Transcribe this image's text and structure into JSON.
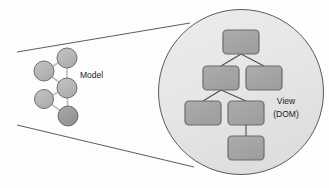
{
  "diagram": {
    "background_color": "#fdfdfd",
    "labels": {
      "model": "Model",
      "view_line1": "View",
      "view_line2": "(DOM)"
    },
    "colors": {
      "node_fill": "#b3b3b3",
      "node_fill_dark": "#9a9a9a",
      "node_stroke": "#6e6e6e",
      "edge_stroke": "#b8b8b8",
      "box_fill": "#a6a6a6",
      "box_stroke": "#6b6b6b",
      "lens_fill": "#e8e8e8",
      "lens_stroke": "#5a5a5a",
      "cone_stroke": "#4a4a4a",
      "text": "#1b1b1b"
    },
    "model_graph": {
      "caption": "Model",
      "nodes": [
        {
          "id": "m1",
          "label": "",
          "cx": 67,
          "cy": 58,
          "r": 10,
          "shade": "light"
        },
        {
          "id": "m2",
          "label": "",
          "cx": 44,
          "cy": 71,
          "r": 10,
          "shade": "light"
        },
        {
          "id": "m3",
          "label": "",
          "cx": 67,
          "cy": 88,
          "r": 10,
          "shade": "light"
        },
        {
          "id": "m4",
          "label": "",
          "cx": 44,
          "cy": 99,
          "r": 9,
          "shade": "light"
        },
        {
          "id": "m5",
          "label": "",
          "cx": 68,
          "cy": 116,
          "r": 10,
          "shade": "dark"
        }
      ],
      "edges": [
        {
          "from": "m2",
          "to": "m1"
        },
        {
          "from": "m2",
          "to": "m3"
        },
        {
          "from": "m1",
          "to": "m3"
        },
        {
          "from": "m4",
          "to": "m3"
        },
        {
          "from": "m3",
          "to": "m5"
        },
        {
          "from": "m4",
          "to": "m5"
        }
      ]
    },
    "magnifier": {
      "cx": 241,
      "cy": 92,
      "r": 83,
      "caption_line1": "View",
      "caption_line2": "(DOM)",
      "caption_x": 286,
      "caption_y": 103
    },
    "cone": {
      "top_from": {
        "x": 17,
        "y": 52
      },
      "top_to": {
        "x": 186,
        "y": 25
      },
      "bottom_from": {
        "x": 17,
        "y": 125
      },
      "bottom_to": {
        "x": 190,
        "y": 166
      }
    },
    "dom_tree": {
      "caption": "View (DOM)",
      "boxes": [
        {
          "id": "d1",
          "label": "",
          "x": 223,
          "y": 30,
          "w": 36,
          "h": 24
        },
        {
          "id": "d2",
          "label": "",
          "x": 203,
          "y": 66,
          "w": 36,
          "h": 24
        },
        {
          "id": "d3",
          "label": "",
          "x": 246,
          "y": 66,
          "w": 36,
          "h": 24
        },
        {
          "id": "d4",
          "label": "",
          "x": 185,
          "y": 101,
          "w": 36,
          "h": 24
        },
        {
          "id": "d5",
          "label": "",
          "x": 228,
          "y": 101,
          "w": 36,
          "h": 24
        },
        {
          "id": "d6",
          "label": "",
          "x": 228,
          "y": 136,
          "w": 36,
          "h": 24
        }
      ],
      "edges": [
        {
          "from": "d1",
          "to": "d2"
        },
        {
          "from": "d1",
          "to": "d3"
        },
        {
          "from": "d2",
          "to": "d4"
        },
        {
          "from": "d2",
          "to": "d5"
        },
        {
          "from": "d5",
          "to": "d6"
        }
      ]
    }
  }
}
